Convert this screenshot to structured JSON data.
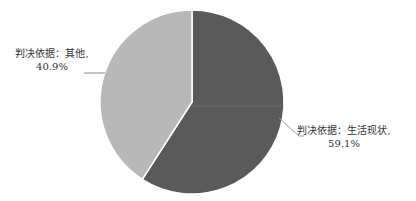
{
  "chart_data": {
    "type": "pie",
    "title": "",
    "slices": [
      {
        "label": "判决依据：生活现状",
        "value": 59.1,
        "display": "59.1%",
        "color": "#5a5a5a"
      },
      {
        "label": "判决依据：其他",
        "value": 40.9,
        "display": "40.9%",
        "color": "#b8b8b8"
      }
    ],
    "start_angle_deg": 0,
    "direction": "clockwise",
    "legend": "none",
    "data_labels": "outside with leader lines"
  },
  "labels": {
    "other_name": "判决依据：其他,",
    "other_value": "40.9%",
    "life_name": "判决依据：生活现状,",
    "life_value": "59.1%"
  }
}
